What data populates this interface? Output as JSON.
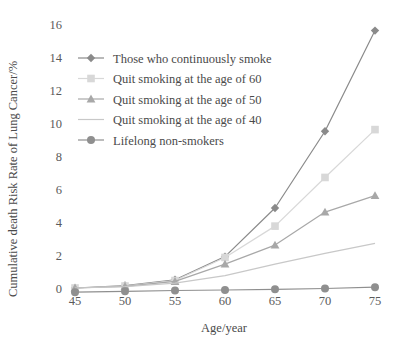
{
  "chart_data": {
    "type": "line",
    "title": "",
    "xlabel": "Age/year",
    "ylabel": "Cumulative death Risk Rate of Lung Cancer/%",
    "x": [
      45,
      50,
      55,
      60,
      65,
      70,
      75
    ],
    "xlim": [
      45,
      75
    ],
    "ylim": [
      0,
      16
    ],
    "xticks": [
      "45",
      "50",
      "55",
      "60",
      "65",
      "70",
      "75"
    ],
    "yticks": [
      "0",
      "2",
      "4",
      "6",
      "8",
      "10",
      "12",
      "14",
      "16"
    ],
    "grid": false,
    "legend_position": "upper-left",
    "series": [
      {
        "name": "Those who continuously smoke",
        "marker": "diamond",
        "color": "#8a8a8a",
        "values": [
          0.0,
          0.15,
          0.5,
          1.9,
          4.85,
          9.5,
          15.6
        ]
      },
      {
        "name": "Quit smoking at the age of 60",
        "marker": "square",
        "color": "#d8d8d8",
        "values": [
          0.0,
          0.12,
          0.45,
          1.85,
          3.75,
          6.7,
          9.6
        ]
      },
      {
        "name": "Quit smoking at the age of 50",
        "marker": "triangle",
        "color": "#a8a8a8",
        "values": [
          0.0,
          0.1,
          0.4,
          1.45,
          2.6,
          4.6,
          5.6
        ]
      },
      {
        "name": "Quit smoking at the age of 40",
        "marker": "none",
        "color": "#c8c8c8",
        "values": [
          0.0,
          0.08,
          0.3,
          0.75,
          1.45,
          2.1,
          2.7
        ]
      },
      {
        "name": "Lifelong non-smokers",
        "marker": "circle",
        "color": "#8f8f8f",
        "values": [
          -0.25,
          -0.2,
          -0.15,
          -0.12,
          -0.08,
          -0.03,
          0.05
        ]
      }
    ]
  }
}
